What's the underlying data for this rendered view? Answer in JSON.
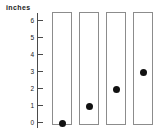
{
  "chart_data": {
    "type": "scatter",
    "title": "",
    "ylabel": "inches",
    "xlabel": "",
    "ylim": [
      0,
      6
    ],
    "grid": false,
    "legend": false,
    "y_ticks": [
      6,
      5,
      4,
      3,
      2,
      1,
      0
    ],
    "y_tick_labels": [
      "6",
      "5",
      "4",
      "3",
      "2",
      "1",
      "0"
    ],
    "categories": [
      "1",
      "2",
      "3",
      "4"
    ],
    "values": [
      0,
      1,
      2,
      3
    ],
    "unit": "inches",
    "points": [
      {
        "column": 1,
        "value": 0
      },
      {
        "column": 2,
        "value": 1
      },
      {
        "column": 3,
        "value": 2
      },
      {
        "column": 4,
        "value": 3
      }
    ]
  },
  "axis": {
    "label": "inches",
    "ticks": [
      {
        "label": "6",
        "value": 6
      },
      {
        "label": "5",
        "value": 5
      },
      {
        "label": "4",
        "value": 4
      },
      {
        "label": "3",
        "value": 3
      },
      {
        "label": "2",
        "value": 2
      },
      {
        "label": "1",
        "value": 1
      },
      {
        "label": "0",
        "value": 0
      }
    ]
  },
  "colors": {
    "background": "#ffffff",
    "axis_line": "#4a4a4a",
    "tick_text": "#1a1a1a",
    "column_border": "#8c8c8c",
    "column_fill": "#ffffff",
    "dot": "#111111"
  },
  "geometry": {
    "axis_x": 37,
    "axis_top": 13,
    "axis_bottom": 128,
    "value0_y": 122,
    "unit_px": 17,
    "column_top": 12,
    "column_height": 113,
    "column_width": 20,
    "column_x": [
      52,
      79,
      106,
      133
    ]
  }
}
